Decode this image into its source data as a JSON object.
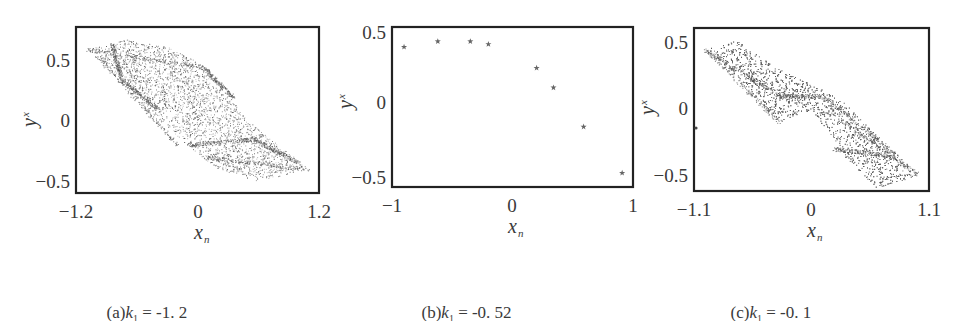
{
  "figure": {
    "panels": [
      {
        "id": "a",
        "caption_prefix": "(a)",
        "caption_var": "k",
        "caption_sub": "1",
        "caption_value": " = -1. 2",
        "frame": {
          "x0": 76,
          "y0": 27,
          "x1": 319,
          "y1": 193
        },
        "xlim": [
          -1.2,
          1.2
        ],
        "xticks": [
          {
            "v": -1.2,
            "label": "-1.2",
            "px": 76
          },
          {
            "v": 0,
            "label": "0",
            "px": 198
          },
          {
            "v": 1.2,
            "label": "1.2",
            "px": 319
          }
        ],
        "yticks": [
          {
            "v": 0.5,
            "label": "0.5",
            "py": 61
          },
          {
            "v": 0,
            "label": "0",
            "py": 121
          },
          {
            "v": -0.5,
            "label": "-0.5",
            "py": 182
          }
        ],
        "xlabel": "x",
        "xlabel_sub": "n",
        "ylabel": "y",
        "ylabel_sub": "x",
        "kind": "chaotic"
      },
      {
        "id": "b",
        "caption_prefix": "(b)",
        "caption_var": "k",
        "caption_sub": "1",
        "caption_value": " = -0. 52",
        "frame": {
          "x0": 392,
          "y0": 27,
          "x1": 633,
          "y1": 187
        },
        "xlim": [
          -1,
          1
        ],
        "xticks": [
          {
            "v": -1,
            "label": "-1",
            "px": 392
          },
          {
            "v": 0,
            "label": "0",
            "px": 512
          },
          {
            "v": 1,
            "label": "1",
            "px": 633
          }
        ],
        "yticks": [
          {
            "v": 0.5,
            "label": "0.5",
            "py": 33
          },
          {
            "v": 0,
            "label": "0",
            "py": 103
          },
          {
            "v": -0.5,
            "label": "-0.5",
            "py": 178
          }
        ],
        "xlabel": "x",
        "xlabel_sub": "n",
        "ylabel": "y",
        "ylabel_sub": "x",
        "kind": "periodic"
      },
      {
        "id": "c",
        "caption_prefix": "(c)",
        "caption_var": "k",
        "caption_sub": "1",
        "caption_value": " = -0. 1",
        "frame": {
          "x0": 694,
          "y0": 28,
          "x1": 929,
          "y1": 191
        },
        "xlim": [
          -1.1,
          1.1
        ],
        "xticks": [
          {
            "v": -1.1,
            "label": "-1.1",
            "px": 694
          },
          {
            "v": 0,
            "label": "0",
            "px": 811
          },
          {
            "v": 1.1,
            "label": "1.1",
            "px": 929
          }
        ],
        "yticks": [
          {
            "v": 0.5,
            "label": "0.5",
            "py": 43
          },
          {
            "v": 0,
            "label": "0",
            "py": 109
          },
          {
            "v": -0.5,
            "label": "-0.5",
            "py": 176
          }
        ],
        "xlabel": "x",
        "xlabel_sub": "n",
        "ylabel": "y",
        "ylabel_sub": "x",
        "kind": "chaotic"
      }
    ],
    "colors": {
      "frame": "#222222",
      "points": "#555555",
      "text": "#3a3a3a"
    }
  },
  "chart_data": [
    {
      "type": "scatter",
      "title": "(a) k1 = -1.2",
      "xlabel": "x_n",
      "ylabel": "y_x",
      "xlim": [
        -1.2,
        1.2
      ],
      "ylim": [
        -0.55,
        0.72
      ],
      "xticks": [
        -1.2,
        0,
        1.2
      ],
      "yticks": [
        -0.5,
        0,
        0.5
      ],
      "description": "Dense chaotic attractor: parallelogram band from (-1.1, 0.6) to (1.1, -0.4) with dense ridges near y=0.5 and y=-0.3",
      "envelope": [
        [
          -1.1,
          0.6
        ],
        [
          -0.7,
          0.68
        ],
        [
          -0.3,
          0.62
        ],
        [
          0.1,
          0.45
        ],
        [
          0.5,
          0.0
        ],
        [
          1.1,
          -0.4
        ],
        [
          0.6,
          -0.5
        ],
        [
          0.2,
          -0.4
        ],
        [
          -0.1,
          -0.2
        ],
        [
          -0.5,
          0.1
        ],
        [
          -0.9,
          0.45
        ]
      ]
    },
    {
      "type": "scatter",
      "title": "(b) k1 = -0.52",
      "xlabel": "x_n",
      "ylabel": "y_x",
      "xlim": [
        -1,
        1
      ],
      "ylim": [
        -0.55,
        0.5
      ],
      "xticks": [
        -1,
        0,
        1
      ],
      "yticks": [
        -0.5,
        0,
        0.5
      ],
      "marker": "star",
      "x": [
        -0.9,
        -0.62,
        -0.35,
        -0.2,
        0.2,
        0.34,
        0.59,
        0.91
      ],
      "y": [
        0.4,
        0.44,
        0.44,
        0.42,
        0.25,
        0.11,
        -0.17,
        -0.5
      ]
    },
    {
      "type": "scatter",
      "title": "(c) k1 = -0.1",
      "xlabel": "x_n",
      "ylabel": "y_x",
      "xlim": [
        -1.1,
        1.1
      ],
      "ylim": [
        -0.6,
        0.56
      ],
      "xticks": [
        -1.1,
        0,
        1.1
      ],
      "yticks": [
        -0.5,
        0,
        0.5
      ],
      "description": "Two-lobed chaotic attractor: upper-left lobe from (-1.0, 0.45) to (-0.3, -0.1), lower-right lobe from (0.1, 0.15) to (1.0, -0.5), joined near origin",
      "envelope": [
        [
          -1.0,
          0.45
        ],
        [
          -0.7,
          0.52
        ],
        [
          -0.3,
          0.3
        ],
        [
          0.1,
          0.15
        ],
        [
          0.3,
          0.05
        ],
        [
          1.0,
          -0.5
        ],
        [
          0.6,
          -0.6
        ],
        [
          0.3,
          -0.35
        ],
        [
          0.0,
          0.0
        ],
        [
          -0.3,
          -0.1
        ],
        [
          -0.7,
          0.25
        ]
      ]
    }
  ]
}
